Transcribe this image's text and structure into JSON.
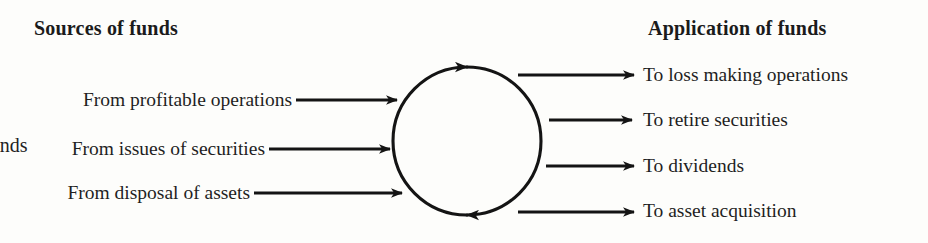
{
  "diagram": {
    "type": "funds-flow-cycle",
    "center_node": {
      "label": "Funds"
    },
    "left_heading": "Sources of funds",
    "right_heading": "Application of funds",
    "sources": [
      {
        "label": "From profitable operations"
      },
      {
        "label": "From issues of securities"
      },
      {
        "label": "From disposal of assets"
      }
    ],
    "applications": [
      {
        "label": "To loss making operations"
      },
      {
        "label": "To retire securities"
      },
      {
        "label": "To dividends"
      },
      {
        "label": "To asset acquisition"
      }
    ],
    "icons": {
      "inflow_arrow": "arrow-right-icon",
      "outflow_arrow": "arrow-right-icon",
      "cycle_top_arrow": "arrow-clockwise-icon",
      "cycle_bottom_arrow": "arrow-clockwise-icon"
    },
    "colors": {
      "ink": "#1a1a1a",
      "background": "#fdfdfb",
      "stroke": "#141414"
    }
  }
}
